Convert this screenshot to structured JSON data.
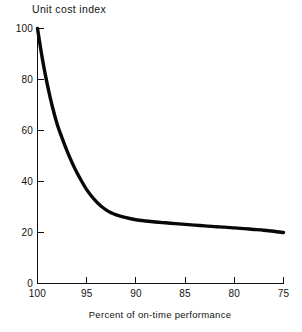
{
  "chart_data": {
    "type": "line",
    "title": "",
    "xlabel": "Percent of on-time performance",
    "ylabel": "Unit cost index",
    "xlim": [
      100,
      75
    ],
    "ylim": [
      0,
      100
    ],
    "grid": false,
    "legend": null,
    "x_ticks": [
      "100",
      "95",
      "90",
      "85",
      "80",
      "75"
    ],
    "x_tick_values": [
      100,
      95,
      90,
      85,
      80,
      75
    ],
    "y_ticks": [
      "0",
      "20",
      "40",
      "60",
      "80",
      "100"
    ],
    "y_tick_values": [
      0,
      20,
      40,
      60,
      80,
      100
    ],
    "x": [
      100,
      99.5,
      99,
      98.5,
      98,
      97.5,
      97,
      96.5,
      96,
      95.5,
      95,
      94.5,
      94,
      93.5,
      93,
      92.5,
      92,
      91,
      90,
      89,
      88,
      87,
      86,
      85,
      84,
      83,
      82,
      81,
      80,
      79,
      78,
      77,
      76,
      75
    ],
    "values": [
      100,
      88,
      78,
      69.5,
      62.5,
      57,
      52,
      47.5,
      43.5,
      40,
      36.8,
      34.2,
      32,
      30.2,
      28.8,
      27.7,
      26.9,
      25.8,
      25.0,
      24.5,
      24.1,
      23.8,
      23.5,
      23.2,
      22.9,
      22.6,
      22.3,
      22.1,
      21.8,
      21.5,
      21.2,
      20.9,
      20.5,
      20
    ],
    "series": [
      {
        "name": "Unit cost index",
        "color": "#080808",
        "values": [
          100,
          88,
          78,
          69.5,
          62.5,
          57,
          52,
          47.5,
          43.5,
          40,
          36.8,
          34.2,
          32,
          30.2,
          28.8,
          27.7,
          26.9,
          25.8,
          25.0,
          24.5,
          24.1,
          23.8,
          23.5,
          23.2,
          22.9,
          22.6,
          22.3,
          22.1,
          21.8,
          21.5,
          21.2,
          20.9,
          20.5,
          20
        ]
      }
    ],
    "annotations": []
  },
  "axes": {
    "y_axis_title": "Unit cost index",
    "x_axis_title": "Percent of on-time performance",
    "y_tick_labels": [
      "100",
      "80",
      "60",
      "40",
      "20",
      "0"
    ],
    "x_tick_labels": [
      "100",
      "95",
      "90",
      "85",
      "80",
      "75"
    ]
  },
  "colors": {
    "curve": "#080808",
    "axis": "#101010",
    "text": "#121212",
    "background": "#ffffff"
  }
}
